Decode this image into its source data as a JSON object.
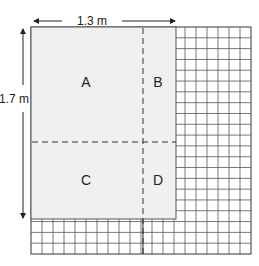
{
  "diagram": {
    "width_label": "1.3 m",
    "height_label": "1.7 m",
    "regions": [
      {
        "id": "A",
        "label": "A"
      },
      {
        "id": "B",
        "label": "B"
      },
      {
        "id": "C",
        "label": "C"
      },
      {
        "id": "D",
        "label": "D"
      }
    ],
    "colors": {
      "shaded": "#f0f0f0",
      "grid_line": "#444444",
      "dashed_line": "#333333",
      "text": "#222222"
    }
  }
}
